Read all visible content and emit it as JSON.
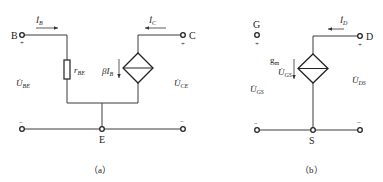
{
  "circuit_a": {
    "caption": "（a）",
    "terminals": {
      "base": "B",
      "collector": "C",
      "emitter": "E"
    },
    "current_base": {
      "main": "İ",
      "sub": "B"
    },
    "current_collector": {
      "main": "İ",
      "sub": "C"
    },
    "resistor": {
      "main": "r",
      "sub": "BE"
    },
    "source": {
      "main": "βI",
      "sub": "B"
    },
    "voltage_be": {
      "main": "U̇",
      "sub": "BE"
    },
    "voltage_ce": {
      "main": "U̇",
      "sub": "CE"
    },
    "plus": "+",
    "minus": "−"
  },
  "circuit_b": {
    "caption": "（b）",
    "terminals": {
      "gate": "G",
      "drain": "D",
      "source": "S"
    },
    "current_drain": {
      "main": "İ",
      "sub": "D"
    },
    "source_gm": {
      "main": "g",
      "sub": "m"
    },
    "source_ugs": {
      "main": "U̇",
      "sub": "GS"
    },
    "voltage_gs": {
      "main": "U̇",
      "sub": "GS"
    },
    "voltage_ds": {
      "main": "U̇",
      "sub": "DS"
    },
    "plus": "+",
    "minus": "−"
  }
}
